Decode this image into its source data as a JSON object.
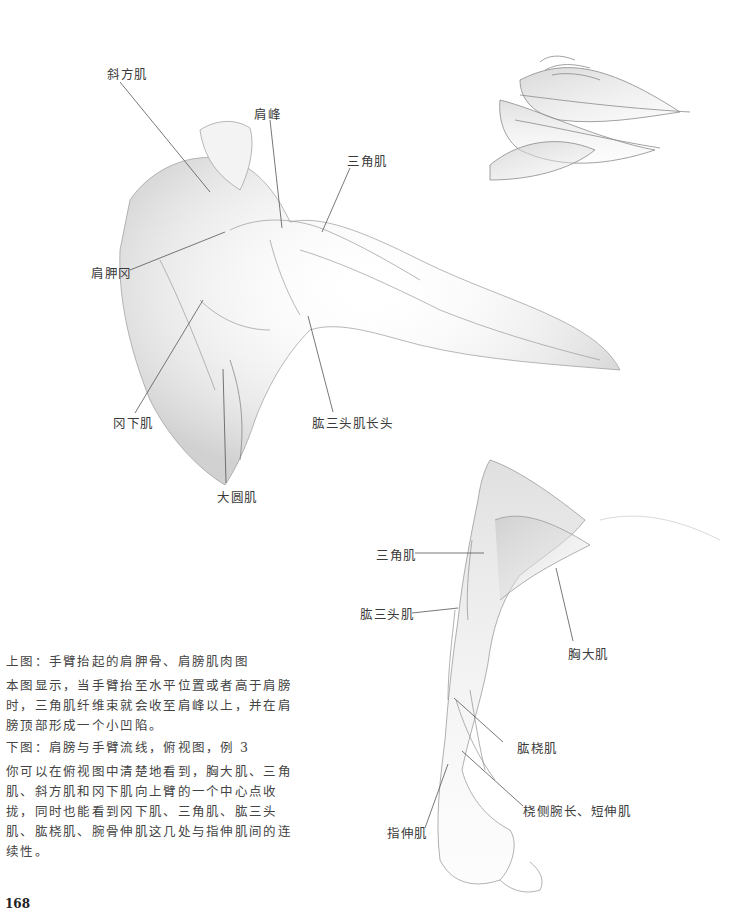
{
  "page_number": "168",
  "top_figure": {
    "labels": {
      "trapezius": "斜方肌",
      "acromion": "肩峰",
      "deltoid": "三角肌",
      "scapular_spine": "肩胛冈",
      "infraspinatus": "冈下肌",
      "triceps_long_head": "肱三头肌长头",
      "teres_major": "大圆肌"
    }
  },
  "bottom_figure": {
    "labels": {
      "deltoid": "三角肌",
      "triceps": "肱三头肌",
      "pectoralis_major": "胸大肌",
      "brachioradialis": "肱桡肌",
      "ecr_longus_brevis": "桡侧腕长、短伸肌",
      "extensor_digitorum": "指伸肌"
    }
  },
  "captions": {
    "top": {
      "title": "上图：手臂抬起的肩胛骨、肩膀肌肉图",
      "body": "本图显示，当手臂抬至水平位置或者高于肩膀时，三角肌纤维束就会收至肩峰以上，并在肩膀顶部形成一个小凹陷。"
    },
    "bottom": {
      "title": "下图：肩膀与手臂流线，俯视图，例 3",
      "body": "你可以在俯视图中清楚地看到，胸大肌、三角肌、斜方肌和冈下肌向上臂的一个中心点收拢，同时也能看到冈下肌、三角肌、肱三头肌、肱桡肌、腕骨伸肌这几处与指伸肌间的连续性。"
    }
  }
}
